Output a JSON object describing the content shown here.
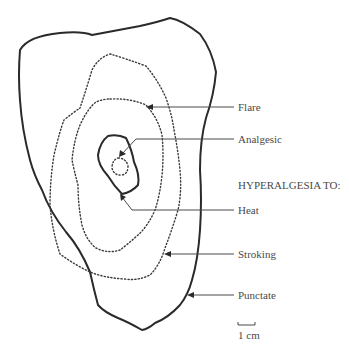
{
  "diagram": {
    "type": "area-map",
    "labels": {
      "flare": "Flare",
      "analgesic": "Analgesic",
      "heading": "HYPERALGESIA TO:",
      "heat": "Heat",
      "stroking": "Stroking",
      "punctate": "Punctate"
    },
    "scale_bar": {
      "label": "1 cm"
    },
    "contours": [
      {
        "name": "Punctate",
        "style": "solid"
      },
      {
        "name": "Flare",
        "style": "dotted"
      },
      {
        "name": "Stroking",
        "style": "dotted"
      },
      {
        "name": "Heat",
        "style": "solid"
      },
      {
        "name": "Analgesic",
        "style": "dotted"
      }
    ]
  }
}
